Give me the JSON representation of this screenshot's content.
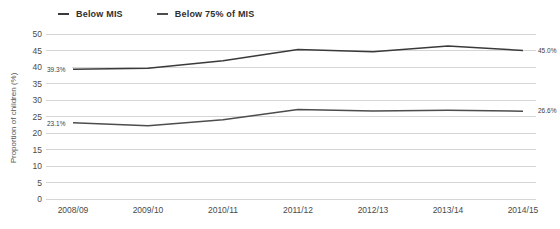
{
  "chart_data": {
    "type": "line",
    "title": "",
    "xlabel": "",
    "ylabel": "Proportion of children (%)",
    "ylim": [
      0,
      50
    ],
    "ytick_step": 5,
    "grid": "horizontal-only",
    "legend_position": "top-left",
    "categories": [
      "2008/09",
      "2009/10",
      "2010/11",
      "2011/12",
      "2012/13",
      "2013/14",
      "2014/15"
    ],
    "series": [
      {
        "name": "Below MIS",
        "color": "#3a3a3a",
        "values": [
          39.3,
          39.6,
          41.9,
          45.3,
          44.6,
          46.4,
          45.0
        ],
        "first_point_label": "39.3%",
        "last_point_label": "45.0%"
      },
      {
        "name": "Below 75% of MIS",
        "color": "#4d4d4d",
        "values": [
          23.1,
          22.2,
          24.0,
          27.1,
          26.7,
          26.9,
          26.6
        ],
        "first_point_label": "23.1%",
        "last_point_label": "26.6%"
      }
    ],
    "colors": {
      "gridline": "#d5d5d5",
      "tick_text": "#4a4a4a",
      "axis_text": "#555555",
      "annotation_text": "#3d3d3d",
      "background": "#ffffff"
    }
  }
}
